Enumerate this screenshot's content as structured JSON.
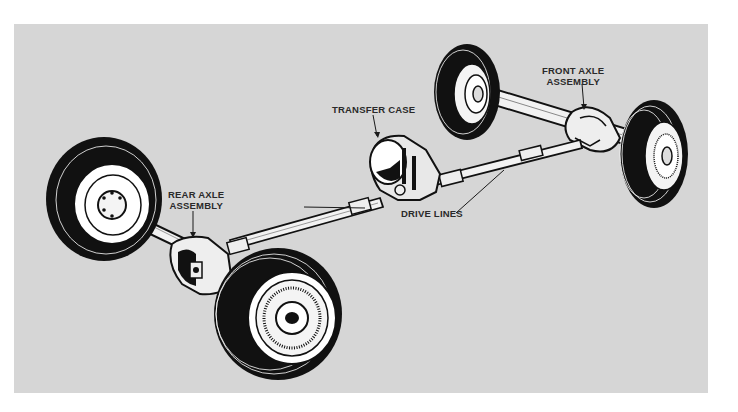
{
  "diagram": {
    "background_color": "#d6d6d6",
    "ink_color": "#1a1a1a",
    "labels": {
      "front_axle": {
        "line1": "FRONT AXLE",
        "line2": "ASSEMBLY"
      },
      "transfer_case": {
        "line1": "TRANSFER CASE"
      },
      "rear_axle": {
        "line1": "REAR AXLE",
        "line2": "ASSEMBLY"
      },
      "drive_lines": {
        "line1": "DRIVE LINES"
      }
    },
    "components": [
      "front-left-wheel",
      "front-right-wheel",
      "front-axle-assembly",
      "transfer-case",
      "front-drive-line",
      "rear-drive-line",
      "rear-axle-assembly",
      "rear-left-wheel",
      "rear-right-wheel"
    ]
  }
}
